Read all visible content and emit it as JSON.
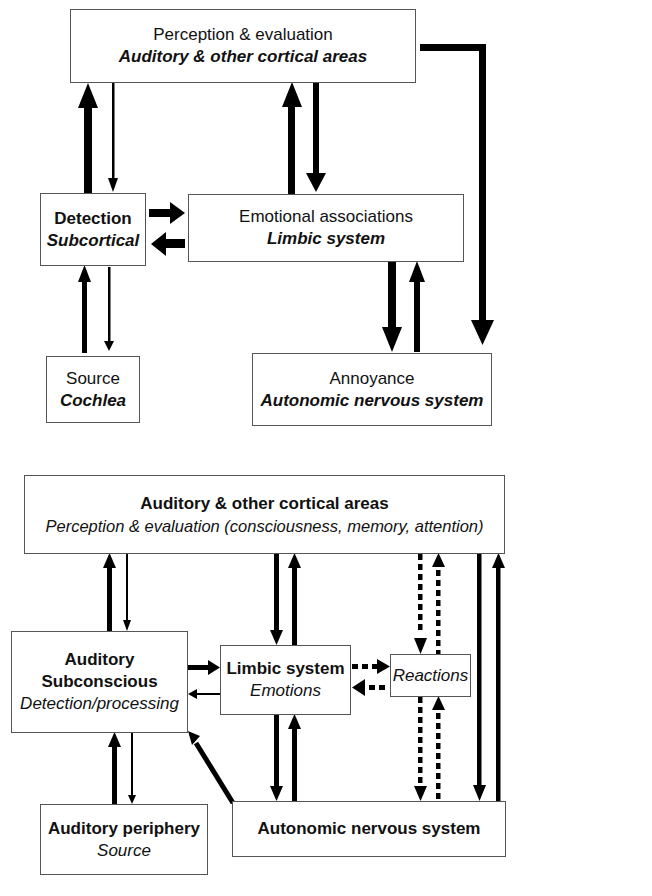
{
  "top_diagram": {
    "nodes": {
      "cortex": {
        "title": "Perception & evaluation",
        "subtitle": "Auditory & other cortical areas"
      },
      "detection": {
        "title": "Detection",
        "subtitle": "Subcortical"
      },
      "emotion": {
        "title": "Emotional associations",
        "subtitle": "Limbic system"
      },
      "source": {
        "title": "Source",
        "subtitle": "Cochlea"
      },
      "annoyance": {
        "title": "Annoyance",
        "subtitle": "Autonomic nervous system"
      }
    },
    "edges": [
      {
        "from": "detection",
        "to": "cortex",
        "weight": "thick"
      },
      {
        "from": "cortex",
        "to": "detection",
        "weight": "thin"
      },
      {
        "from": "emotion",
        "to": "cortex",
        "weight": "thick"
      },
      {
        "from": "cortex",
        "to": "emotion",
        "weight": "medium"
      },
      {
        "from": "detection",
        "to": "emotion",
        "weight": "thick"
      },
      {
        "from": "emotion",
        "to": "detection",
        "weight": "thick"
      },
      {
        "from": "source",
        "to": "detection",
        "weight": "medium"
      },
      {
        "from": "detection",
        "to": "source",
        "weight": "thin"
      },
      {
        "from": "emotion",
        "to": "annoyance",
        "weight": "thick"
      },
      {
        "from": "annoyance",
        "to": "emotion",
        "weight": "medium"
      },
      {
        "from": "cortex",
        "to": "annoyance",
        "weight": "thick"
      }
    ]
  },
  "bottom_diagram": {
    "nodes": {
      "cortex": {
        "title": "Auditory & other cortical areas",
        "subtitle": "Perception & evaluation (consciousness, memory, attention)"
      },
      "subconscious": {
        "title_line1": "Auditory",
        "title_line2": "Subconscious",
        "subtitle": "Detection/processing"
      },
      "limbic": {
        "title": "Limbic system",
        "subtitle": "Emotions"
      },
      "reactions": {
        "subtitle": "Reactions"
      },
      "periphery": {
        "title": "Auditory periphery",
        "subtitle": "Source"
      },
      "ans": {
        "title": "Autonomic nervous system"
      }
    },
    "edges": [
      {
        "from": "subconscious",
        "to": "cortex",
        "style": "solid"
      },
      {
        "from": "cortex",
        "to": "subconscious",
        "style": "thin"
      },
      {
        "from": "cortex",
        "to": "limbic",
        "style": "solid"
      },
      {
        "from": "limbic",
        "to": "cortex",
        "style": "solid"
      },
      {
        "from": "subconscious",
        "to": "limbic",
        "style": "solid"
      },
      {
        "from": "limbic",
        "to": "subconscious",
        "style": "thin"
      },
      {
        "from": "limbic",
        "to": "reactions",
        "style": "dashed"
      },
      {
        "from": "reactions",
        "to": "limbic",
        "style": "dashed"
      },
      {
        "from": "cortex",
        "to": "reactions",
        "style": "dashed"
      },
      {
        "from": "reactions",
        "to": "cortex",
        "style": "dashed"
      },
      {
        "from": "reactions",
        "to": "ans",
        "style": "dashed"
      },
      {
        "from": "ans",
        "to": "reactions",
        "style": "dashed"
      },
      {
        "from": "limbic",
        "to": "ans",
        "style": "solid"
      },
      {
        "from": "ans",
        "to": "limbic",
        "style": "solid"
      },
      {
        "from": "cortex",
        "to": "ans",
        "style": "solid"
      },
      {
        "from": "ans",
        "to": "cortex",
        "style": "solid"
      },
      {
        "from": "periphery",
        "to": "subconscious",
        "style": "solid"
      },
      {
        "from": "subconscious",
        "to": "periphery",
        "style": "thin"
      },
      {
        "from": "ans",
        "to": "subconscious",
        "style": "solid"
      }
    ]
  }
}
